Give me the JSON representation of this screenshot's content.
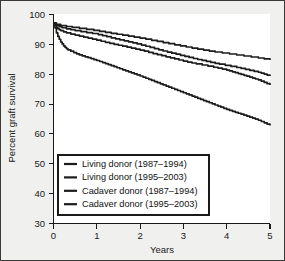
{
  "chart_data": {
    "type": "line",
    "title": "",
    "xlabel": "Years",
    "ylabel": "Percent graft survival",
    "xlim": [
      0,
      5
    ],
    "ylim": [
      30,
      100
    ],
    "xticks": [
      0,
      1,
      2,
      3,
      4,
      5
    ],
    "yticks": [
      30,
      40,
      50,
      60,
      70,
      80,
      90,
      100
    ],
    "xtick_labels": [
      "0",
      "1",
      "2",
      "3",
      "4",
      "5"
    ],
    "ytick_labels": [
      "30",
      "40",
      "50",
      "60",
      "70",
      "80",
      "90",
      "100"
    ],
    "grid": false,
    "legend_position": "lower-left",
    "series": [
      {
        "name": "Living donor (1987–1994)",
        "color": "#1c1c1c",
        "x": [
          0.0,
          0.08,
          0.17,
          0.25,
          0.33,
          0.5,
          0.67,
          0.83,
          1.0,
          1.25,
          1.5,
          1.75,
          2.0,
          2.25,
          2.5,
          2.75,
          3.0,
          3.25,
          3.5,
          3.75,
          4.0,
          4.25,
          4.5,
          4.75,
          5.0
        ],
        "values": [
          97.2,
          96.6,
          96.3,
          96.1,
          95.9,
          95.5,
          95.2,
          94.9,
          94.5,
          93.9,
          93.3,
          92.7,
          92.1,
          91.4,
          90.7,
          90.0,
          89.3,
          88.6,
          88.0,
          87.4,
          86.9,
          86.4,
          85.9,
          85.4,
          84.8
        ]
      },
      {
        "name": "Living donor (1995–2003)",
        "color": "#1c1c1c",
        "x": [
          0.0,
          0.08,
          0.17,
          0.25,
          0.33,
          0.5,
          0.67,
          0.83,
          1.0,
          1.25,
          1.5,
          1.75,
          2.0,
          2.25,
          2.5,
          2.75,
          3.0,
          3.25,
          3.5,
          3.75,
          4.0,
          4.25,
          4.5,
          4.75,
          5.0
        ],
        "values": [
          97.2,
          96.2,
          95.7,
          95.4,
          95.1,
          94.6,
          94.2,
          93.8,
          93.4,
          92.5,
          91.6,
          90.8,
          89.9,
          88.9,
          87.9,
          87.0,
          86.1,
          85.2,
          84.4,
          83.6,
          82.9,
          82.2,
          81.4,
          80.6,
          79.4
        ]
      },
      {
        "name": "Cadaver donor (1987–1994)",
        "color": "#1c1c1c",
        "x": [
          0.0,
          0.08,
          0.17,
          0.25,
          0.33,
          0.5,
          0.67,
          0.83,
          1.0,
          1.25,
          1.5,
          1.75,
          2.0,
          2.25,
          2.5,
          2.75,
          3.0,
          3.25,
          3.5,
          3.75,
          4.0,
          4.25,
          4.5,
          4.75,
          5.0
        ],
        "values": [
          97.2,
          95.4,
          94.6,
          94.1,
          93.7,
          93.1,
          92.5,
          92.0,
          91.4,
          90.5,
          89.7,
          88.9,
          88.1,
          87.1,
          86.2,
          85.3,
          84.4,
          83.6,
          82.9,
          82.2,
          81.4,
          80.3,
          79.2,
          78.0,
          76.4
        ]
      },
      {
        "name": "Cadaver donor (1995–2003)",
        "color": "#1c1c1c",
        "x": [
          0.0,
          0.08,
          0.17,
          0.25,
          0.33,
          0.5,
          0.67,
          0.83,
          1.0,
          1.25,
          1.5,
          1.75,
          2.0,
          2.25,
          2.5,
          2.75,
          3.0,
          3.25,
          3.5,
          3.75,
          4.0,
          4.25,
          4.5,
          4.75,
          5.0
        ],
        "values": [
          97.2,
          93.2,
          90.7,
          89.2,
          88.2,
          87.0,
          86.1,
          85.4,
          84.6,
          83.3,
          82.0,
          80.7,
          79.4,
          78.0,
          76.6,
          75.2,
          73.8,
          72.4,
          71.0,
          69.6,
          68.2,
          67.0,
          65.8,
          64.5,
          62.8
        ]
      }
    ]
  },
  "legend": {
    "items": [
      {
        "label": "Living donor (1987–1994)"
      },
      {
        "label": "Living donor (1995–2003)"
      },
      {
        "label": "Cadaver donor (1987–1994)"
      },
      {
        "label": "Cadaver donor (1995–2003)"
      }
    ]
  }
}
